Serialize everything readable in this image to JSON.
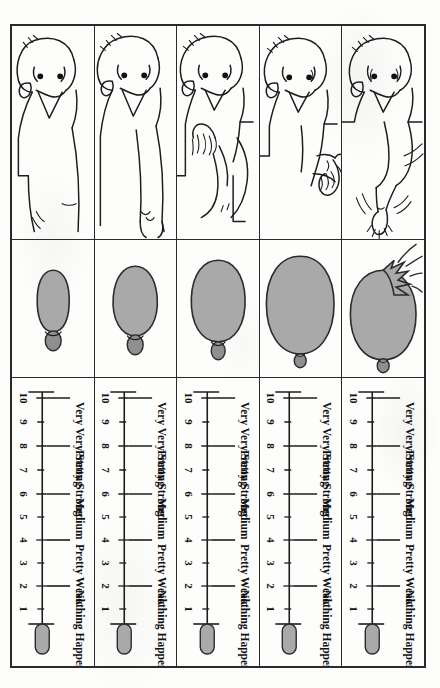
{
  "figure": {
    "type": "illustrated-rating-scale-table",
    "columns": [
      "person illustration",
      "balloon illustration",
      "effort rating scale"
    ],
    "row_count": 5
  },
  "scale": {
    "orientation": "horizontal",
    "numbers_order_left_to_right": [
      "10",
      "9",
      "8",
      "7",
      "6",
      "5",
      "4",
      "3",
      "2",
      "1"
    ],
    "numbers": [
      "1",
      "2",
      "3",
      "4",
      "5",
      "6",
      "7",
      "8",
      "9",
      "10"
    ],
    "max": "10",
    "min": "1",
    "anchors": [
      {
        "value": "10",
        "label": "Very Very Strong"
      },
      {
        "value": "8",
        "label": "Pretty Strong"
      },
      {
        "value": "6",
        "label": "Medium"
      },
      {
        "value": "4",
        "label": "Pretty Weak"
      },
      {
        "value": "2",
        "label": "Nothing Happening"
      }
    ],
    "label_very_very_strong": "Very Very Strong",
    "label_pretty_strong": "Pretty Strong",
    "label_medium": "Medium",
    "label_pretty_weak": "Pretty Weak",
    "label_nothing_happening": "Nothing Happening",
    "end_cap_position": "right",
    "ink_color": "#1d1d1d"
  },
  "colors": {
    "paper": "#fdfdfc",
    "ink": "#1d1d1d",
    "balloon_fill": "#a9a9a9",
    "balloon_stroke": "#2b2b2b",
    "balloon_neck": "#8f8f8f",
    "border": "#2a2a2a"
  },
  "rows": [
    {
      "index": 1,
      "person": "child face with arm raised straining, motion lines",
      "person_effort": "maximal effort",
      "balloon": "very large balloon bursting",
      "balloon_size": "bursting",
      "scale_level": "10"
    },
    {
      "index": 2,
      "person": "child face with bent arm, hand clenched",
      "person_effort": "hard effort",
      "balloon": "large round balloon",
      "balloon_size": "large",
      "scale_level": "8"
    },
    {
      "index": 3,
      "person": "child face with hand on chest, arm bent",
      "person_effort": "moderate effort",
      "balloon": "medium oval balloon",
      "balloon_size": "medium",
      "scale_level": "6"
    },
    {
      "index": 4,
      "person": "child face with arm extended outward",
      "person_effort": "light effort",
      "balloon": "small narrow balloon",
      "balloon_size": "small",
      "scale_level": "4"
    },
    {
      "index": 5,
      "person": "child face resting, relaxed arm",
      "person_effort": "no effort",
      "balloon": "smallest uninflated balloon",
      "balloon_size": "smallest",
      "scale_level": "2"
    }
  ]
}
